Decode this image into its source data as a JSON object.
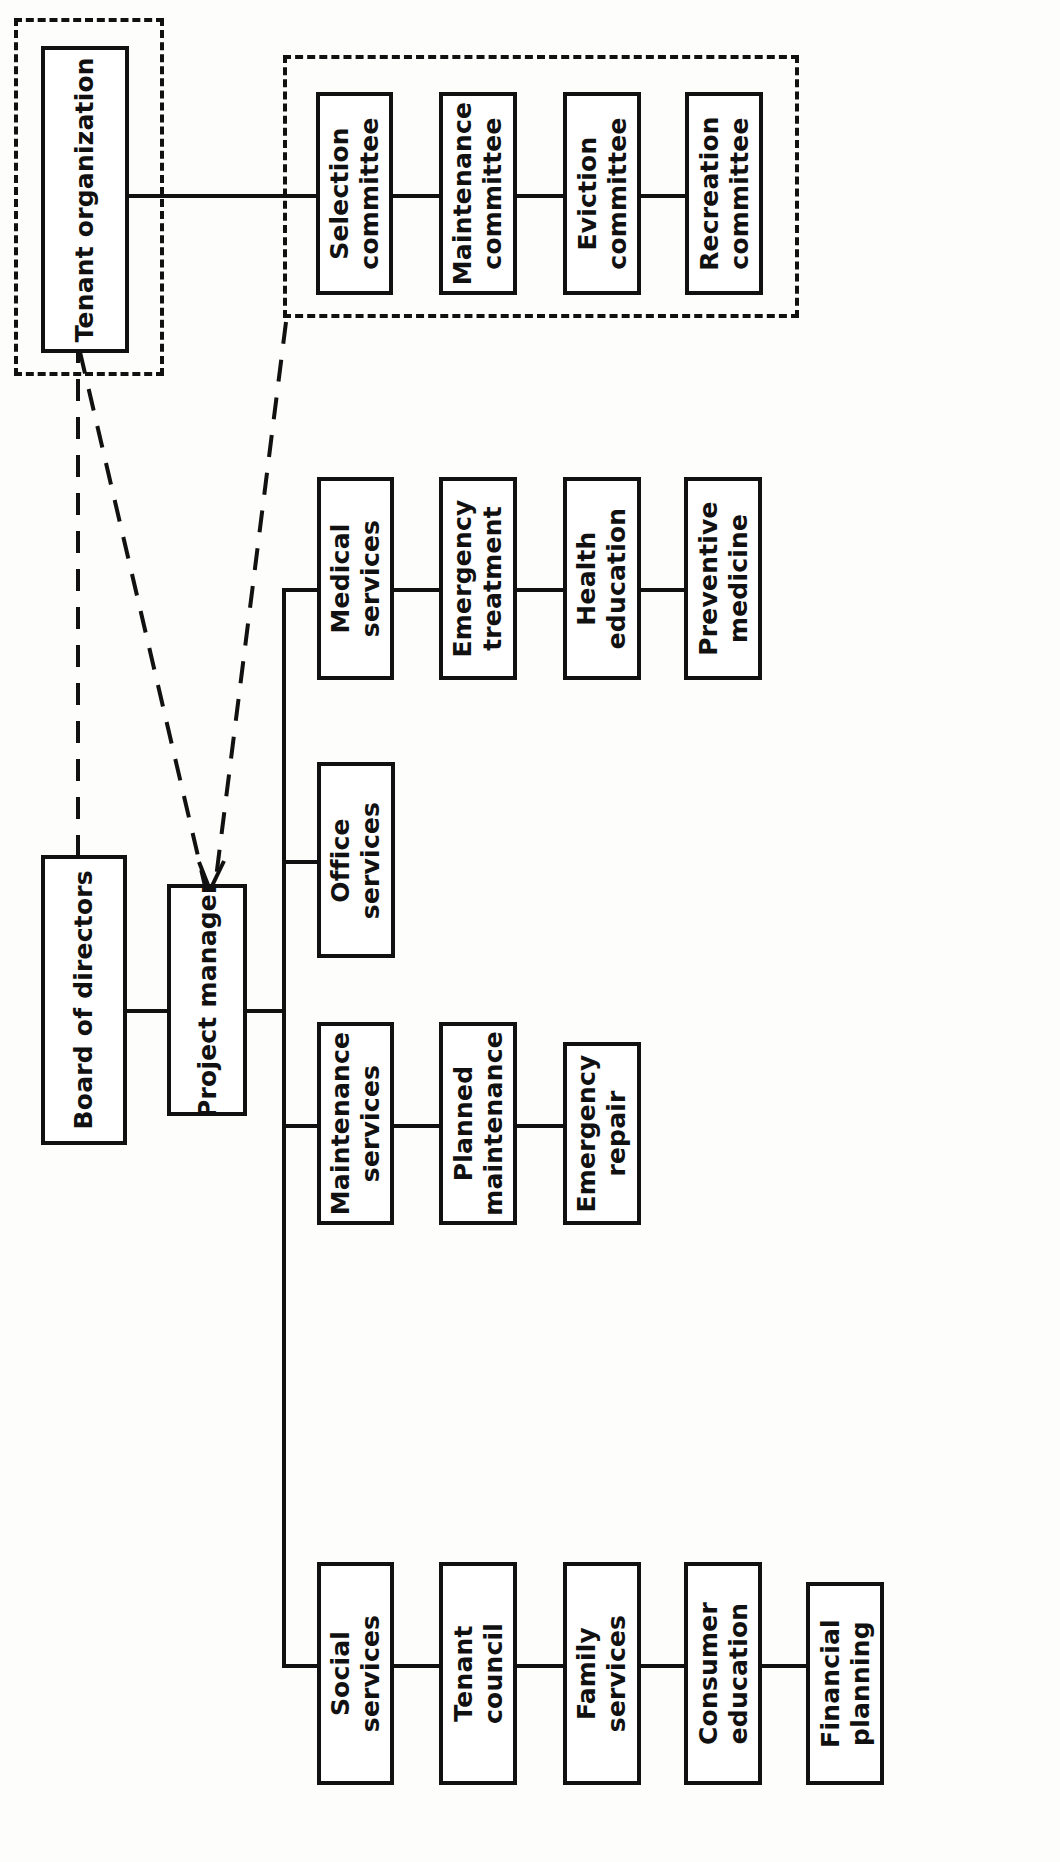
{
  "diagram": {
    "type": "organization-chart",
    "orientation": "rotated-90-ccw",
    "title": "",
    "colors": {
      "line": "#111111",
      "box_fill": "#ffffff",
      "background": "#ffffff"
    },
    "nodes": {
      "tenant_organization": "Tenant organization",
      "board_of_directors": "Board of directors",
      "project_manager": "Project manager",
      "selection_committee": "Selection\ncommittee",
      "maintenance_committee": "Maintenance\ncommittee",
      "eviction_committee": "Eviction\ncommittee",
      "recreation_committee": "Recreation\ncommittee",
      "medical_services": "Medical\nservices",
      "emergency_treatment": "Emergency\ntreatment",
      "health_education": "Health\neducation",
      "preventive_medicine": "Preventive\nmedicine",
      "office_services": "Office\nservices",
      "maintenance_services": "Maintenance\nservices",
      "planned_maintenance": "Planned\nmaintenance",
      "emergency_repair": "Emergency\nrepair",
      "social_services": "Social\nservices",
      "tenant_council": "Tenant\ncouncil",
      "family_services": "Family\nservices",
      "consumer_education": "Consumer\neducation",
      "financial_planning": "Financial\nplanning"
    },
    "groups": [
      {
        "name": "tenant-organization-group",
        "members": [
          "tenant_organization"
        ],
        "style": "dashed"
      },
      {
        "name": "committees-group",
        "members": [
          "selection_committee",
          "maintenance_committee",
          "eviction_committee",
          "recreation_committee"
        ],
        "style": "dashed"
      }
    ],
    "edges": [
      {
        "from": "tenant_organization",
        "to": "selection_committee",
        "style": "solid"
      },
      {
        "from": "selection_committee",
        "to": "maintenance_committee",
        "style": "solid"
      },
      {
        "from": "maintenance_committee",
        "to": "eviction_committee",
        "style": "solid"
      },
      {
        "from": "eviction_committee",
        "to": "recreation_committee",
        "style": "solid"
      },
      {
        "from": "board_of_directors",
        "to": "project_manager",
        "style": "solid"
      },
      {
        "from": "tenant_organization",
        "to": "project_manager",
        "style": "dashed-arrow"
      },
      {
        "from": "committees-group",
        "to": "project_manager",
        "style": "dashed-arrow"
      },
      {
        "from": "board_of_directors",
        "to": "tenant_organization",
        "style": "dashed"
      },
      {
        "from": "project_manager",
        "to": "medical_services",
        "style": "solid"
      },
      {
        "from": "medical_services",
        "to": "emergency_treatment",
        "style": "solid"
      },
      {
        "from": "emergency_treatment",
        "to": "health_education",
        "style": "solid"
      },
      {
        "from": "health_education",
        "to": "preventive_medicine",
        "style": "solid"
      },
      {
        "from": "project_manager",
        "to": "office_services",
        "style": "solid"
      },
      {
        "from": "project_manager",
        "to": "maintenance_services",
        "style": "solid"
      },
      {
        "from": "maintenance_services",
        "to": "planned_maintenance",
        "style": "solid"
      },
      {
        "from": "planned_maintenance",
        "to": "emergency_repair",
        "style": "solid"
      },
      {
        "from": "project_manager",
        "to": "social_services",
        "style": "solid"
      },
      {
        "from": "social_services",
        "to": "tenant_council",
        "style": "solid"
      },
      {
        "from": "tenant_council",
        "to": "family_services",
        "style": "solid"
      },
      {
        "from": "family_services",
        "to": "consumer_education",
        "style": "solid"
      },
      {
        "from": "consumer_education",
        "to": "financial_planning",
        "style": "solid"
      }
    ]
  }
}
